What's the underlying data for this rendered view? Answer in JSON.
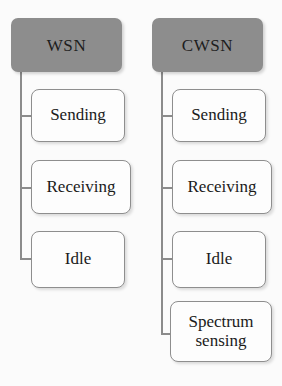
{
  "diagram": {
    "type": "tree-comparison",
    "background_color": "#fbfbfb",
    "header_fill_color": "#8d8d8d",
    "box_border_color": "#8e8e8e",
    "box_fill_color": "#fdfdfd",
    "connector_color": "#8b8b8b",
    "columns": [
      {
        "id": "wsn",
        "header": "WSN",
        "states": [
          {
            "label": "Sending"
          },
          {
            "label": "Receiving"
          },
          {
            "label": "Idle"
          }
        ]
      },
      {
        "id": "cwsn",
        "header": "CWSN",
        "states": [
          {
            "label": "Sending"
          },
          {
            "label": "Receiving"
          },
          {
            "label": "Idle"
          },
          {
            "label": "Spectrum\nsensing"
          }
        ]
      }
    ]
  }
}
